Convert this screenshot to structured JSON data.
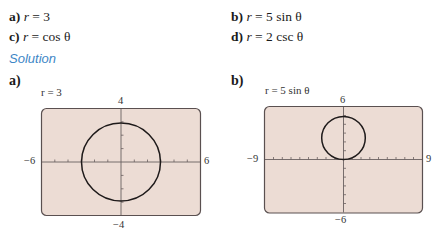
{
  "problems": [
    {
      "letter": "a)",
      "var": "r",
      "eq": "=",
      "rhs": "3"
    },
    {
      "letter": "b)",
      "var": "r",
      "eq": "=",
      "rhs": "5 sin θ"
    },
    {
      "letter": "c)",
      "var": "r",
      "eq": "=",
      "rhs": "cos θ"
    },
    {
      "letter": "d)",
      "var": "r",
      "eq": "=",
      "rhs": "2 csc θ"
    }
  ],
  "solution_heading": "Solution",
  "graphs": [
    {
      "label": "a)",
      "title": "r = 3",
      "xmin": "−6",
      "xmax": "6",
      "ymin": "−4",
      "ymax": "4",
      "frame_color": "#ecdcd4",
      "curve": "circle, center (0,0), radius 3"
    },
    {
      "label": "b)",
      "title": "r = 5 sin θ",
      "xmin": "−9",
      "xmax": "9",
      "ymin": "−6",
      "ymax": "6",
      "frame_color": "#ecdcd4",
      "curve": "circle, center (0,2.5), radius 2.5"
    }
  ]
}
